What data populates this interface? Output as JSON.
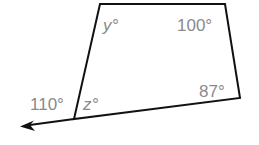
{
  "diagram": {
    "type": "quadrilateral-with-exterior-angle",
    "stroke_color": "#111111",
    "label_color": "#8a8a8a",
    "vertices": {
      "top_left": [
        100,
        4
      ],
      "top_right": [
        225,
        4
      ],
      "bottom_right": [
        240,
        98
      ],
      "bottom_left": [
        74,
        119
      ]
    },
    "ray_end": [
      22,
      126
    ],
    "labels": {
      "angle_top_left": "y°",
      "angle_top_right": "100°",
      "angle_bottom_right": "87°",
      "angle_bottom_left_interior": "z°",
      "angle_exterior": "110°"
    }
  }
}
